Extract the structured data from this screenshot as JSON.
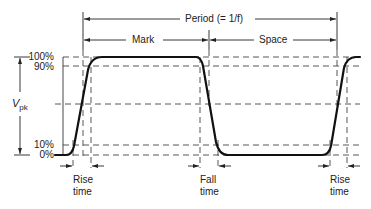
{
  "diagram": {
    "period_label": "Period (= 1/f)",
    "mark_label": "Mark",
    "space_label": "Space",
    "amplitude_label_main": "V",
    "amplitude_label_sub": "pk",
    "levels": [
      {
        "label": "100%",
        "y": 57
      },
      {
        "label": "90%",
        "y": 66
      },
      {
        "label": "10%",
        "y": 145
      },
      {
        "label": "0%",
        "y": 155
      }
    ],
    "mid_level_y": 104,
    "captions": [
      {
        "line1": "Rise",
        "line2": "time"
      },
      {
        "line1": "Fall",
        "line2": "time"
      },
      {
        "line1": "Rise",
        "line2": "time"
      }
    ],
    "colors": {
      "waveform": "#111111",
      "guides": "#333333",
      "background": "#ffffff"
    }
  }
}
